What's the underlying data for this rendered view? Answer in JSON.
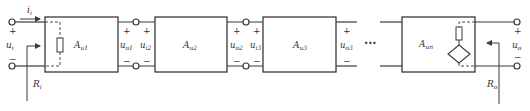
{
  "diagram": {
    "type": "cascaded multistage amplifier block diagram",
    "stroke_color": "#3a3a3a",
    "input": {
      "current_label": "i",
      "current_sub": "i",
      "voltage_label": "u",
      "voltage_sub": "i",
      "plus": "+",
      "minus": "−",
      "resistance_label": "R",
      "resistance_sub": "i"
    },
    "stages": [
      {
        "gain_label": "A",
        "gain_sub": "u1",
        "out_label": "u",
        "out_sub": "o1",
        "next_in_label": "u",
        "next_in_sub": "i2"
      },
      {
        "gain_label": "A",
        "gain_sub": "u2",
        "out_label": "u",
        "out_sub": "o2",
        "next_in_label": "u",
        "next_in_sub": "i3"
      },
      {
        "gain_label": "A",
        "gain_sub": "u3",
        "out_label": "u",
        "out_sub": "o3"
      },
      {
        "gain_label": "A",
        "gain_sub": "un"
      }
    ],
    "ellipsis": "···",
    "output": {
      "voltage_label": "u",
      "voltage_sub": "o",
      "plus": "+",
      "minus": "−",
      "resistance_label": "R",
      "resistance_sub": "o"
    },
    "signs": {
      "plus": "+",
      "minus": "−"
    }
  }
}
